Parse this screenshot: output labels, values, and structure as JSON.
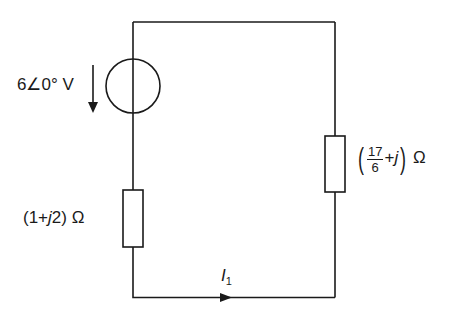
{
  "diagram": {
    "type": "circuit",
    "components": {
      "voltage_source": {
        "label": "6∠0° V",
        "magnitude": "6",
        "angle": "∠0°",
        "unit": "V",
        "direction": "down"
      },
      "left_impedance": {
        "label": "(1+j2) Ω",
        "open": "(1+",
        "j": "j",
        "rest": "2) Ω"
      },
      "right_impedance": {
        "label": "(17/6 + j) Ω",
        "numerator": "17",
        "denominator": "6",
        "plus_j": "+",
        "j": "j",
        "unit": "Ω",
        "open_paren": "(",
        "close_paren": ")"
      },
      "current": {
        "label": "I1",
        "symbol": "I",
        "subscript": "1",
        "direction": "right"
      }
    },
    "colors": {
      "line": "#1a1a1a",
      "background": "#ffffff"
    }
  }
}
